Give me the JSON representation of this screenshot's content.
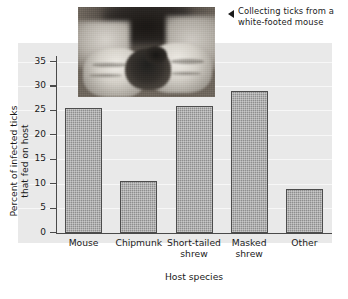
{
  "caption": {
    "arrow_icon": "left-triangle-icon",
    "text": "Collecting ticks from a white-footed mouse"
  },
  "photo": {
    "alt": "Gloved hands holding a white-footed mouse while collecting ticks"
  },
  "chart_data": {
    "type": "bar",
    "title": "",
    "categories": [
      "Mouse",
      "Chipmunk",
      "Short-tailed shrew",
      "Masked shrew",
      "Other"
    ],
    "category_lines": [
      [
        "Mouse"
      ],
      [
        "Chipmunk"
      ],
      [
        "Short-tailed",
        "shrew"
      ],
      [
        "Masked",
        "shrew"
      ],
      [
        "Other"
      ]
    ],
    "values": [
      25.5,
      10.5,
      26,
      29,
      9
    ],
    "xlabel": "Host species",
    "ylabel": "Percent of infected ticks that fed on host",
    "ylabel_lines": [
      "Percent of infected ticks",
      "that fed on host"
    ],
    "ylim": [
      0,
      37
    ],
    "yticks": [
      0,
      5,
      10,
      15,
      20,
      25,
      30,
      35
    ],
    "ytick_labels": [
      "0",
      "5",
      "10",
      "15",
      "20",
      "25",
      "30",
      "35"
    ],
    "grid": true,
    "legend": null,
    "bar_color": "#8e8e8e",
    "bar_edge_color": "#4d4d4d",
    "panel_color": "#e9e9e9",
    "axis_color": "#4a4a4a",
    "text_color": "#1a1a1a"
  }
}
